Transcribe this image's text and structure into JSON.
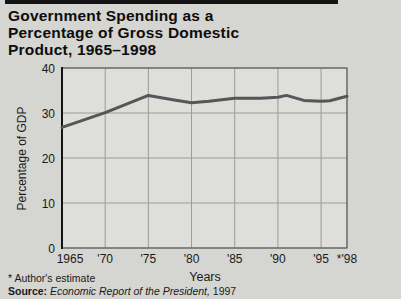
{
  "page": {
    "title_lines": [
      "Government Spending as a",
      "Percentage of Gross Domestic",
      "Product, 1965–1998"
    ],
    "footnote": "* Author's estimate",
    "source": {
      "label": "Source:",
      "work": " Economic Report of the President,",
      "year": " 1997"
    }
  },
  "colors": {
    "background": "#d5d5d1",
    "plot_background": "#dedeDA",
    "grid": "#9b9b97",
    "border": "#4f4f4f",
    "axis": "#141414",
    "line": "#54565a",
    "text": "#1a1a1a",
    "top_rule": "#141414"
  },
  "chart_data": {
    "type": "line",
    "title": "Government Spending as a Percentage of Gross Domestic Product, 1965–1998",
    "xlabel": "Years",
    "ylabel": "Percentage of GDP",
    "xlim": [
      1965,
      1998
    ],
    "ylim": [
      0,
      40
    ],
    "grid": true,
    "legend": "none",
    "x_ticks": [
      {
        "v": 1965,
        "label": "1965",
        "dx": 8
      },
      {
        "v": 1970,
        "label": "'70",
        "dx": 0
      },
      {
        "v": 1975,
        "label": "'75",
        "dx": 0
      },
      {
        "v": 1980,
        "label": "'80",
        "dx": 0
      },
      {
        "v": 1985,
        "label": "'85",
        "dx": 0
      },
      {
        "v": 1990,
        "label": "'90",
        "dx": 0
      },
      {
        "v": 1995,
        "label": "'95",
        "dx": 0
      },
      {
        "v": 1998,
        "label": "*'98",
        "dx": 0
      }
    ],
    "y_ticks": [
      {
        "v": 0,
        "label": "0"
      },
      {
        "v": 10,
        "label": "10"
      },
      {
        "v": 20,
        "label": "20"
      },
      {
        "v": 30,
        "label": "30"
      },
      {
        "v": 40,
        "label": "40"
      }
    ],
    "series": [
      {
        "name": "Government spending as a percentage of GDP",
        "color": "#54565a",
        "x": [
          1965,
          1970,
          1975,
          1978,
          1980,
          1982,
          1985,
          1988,
          1990,
          1991,
          1993,
          1995,
          1996,
          1998
        ],
        "y": [
          26.8,
          30.1,
          33.9,
          32.9,
          32.3,
          32.6,
          33.3,
          33.3,
          33.5,
          33.9,
          32.8,
          32.6,
          32.7,
          33.7
        ]
      }
    ],
    "annotations": [
      "* Author's estimate",
      "1998 value is author's estimate"
    ]
  }
}
